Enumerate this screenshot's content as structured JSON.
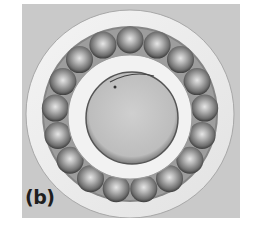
{
  "figure": {
    "panel_label": "(b)",
    "ball_count": 17,
    "colors": {
      "background": "#c9c9c9",
      "outer_ring": "#ececec",
      "groove": "#8a8a8a",
      "ball": "#9a9a9a",
      "inner_ring": "#f0f0f0",
      "bore": "#c4c4c4"
    }
  }
}
